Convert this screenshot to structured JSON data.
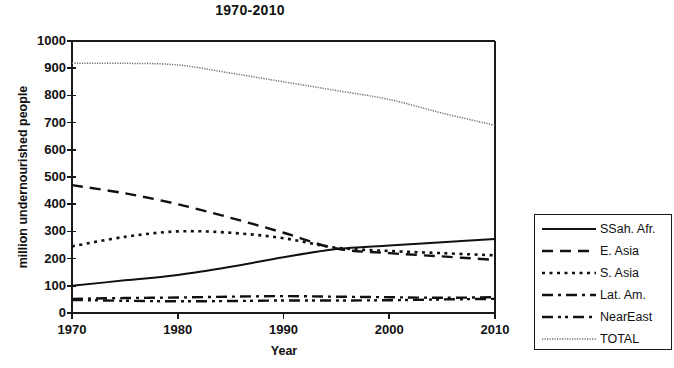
{
  "chart_data": {
    "type": "line",
    "title": "1970-2010",
    "xlabel": "Year",
    "ylabel": "million undernourished people",
    "xlim": [
      1970,
      2010
    ],
    "ylim": [
      0,
      1000
    ],
    "grid": false,
    "legend_position": "right-outside",
    "x": [
      1970,
      1975,
      1980,
      1985,
      1990,
      1995,
      2000,
      2005,
      2010
    ],
    "xticks": [
      "1970",
      "1980",
      "1990",
      "2000",
      "2010"
    ],
    "yticks": [
      "0",
      "100",
      "200",
      "300",
      "400",
      "500",
      "600",
      "700",
      "800",
      "900",
      "1000"
    ],
    "series": [
      {
        "name": "SSah. Afr.",
        "style": "solid",
        "values": [
          100,
          120,
          140,
          170,
          205,
          235,
          248,
          260,
          272
        ]
      },
      {
        "name": "E. Asia",
        "style": "dashed",
        "values": [
          470,
          440,
          400,
          350,
          295,
          237,
          220,
          208,
          195
        ]
      },
      {
        "name": "S. Asia",
        "style": "dotted",
        "values": [
          245,
          280,
          300,
          295,
          275,
          240,
          228,
          220,
          212
        ]
      },
      {
        "name": "Lat. Am.",
        "style": "dashdot",
        "values": [
          52,
          55,
          57,
          60,
          62,
          60,
          58,
          56,
          58
        ]
      },
      {
        "name": "NearEast",
        "style": "dashdotdot",
        "values": [
          48,
          45,
          43,
          44,
          46,
          46,
          47,
          50,
          52
        ]
      },
      {
        "name": "TOTAL",
        "style": "finedot",
        "values": [
          918,
          918,
          912,
          882,
          850,
          818,
          785,
          735,
          690
        ]
      }
    ]
  },
  "legend": {
    "entries": [
      {
        "label": "SSah. Afr."
      },
      {
        "label": "E. Asia"
      },
      {
        "label": "S. Asia"
      },
      {
        "label": "Lat. Am."
      },
      {
        "label": "NearEast"
      },
      {
        "label": "TOTAL"
      }
    ]
  },
  "colors": {
    "ink": "#111111",
    "total_line": "#777777",
    "axis": "#1a1a1a"
  }
}
